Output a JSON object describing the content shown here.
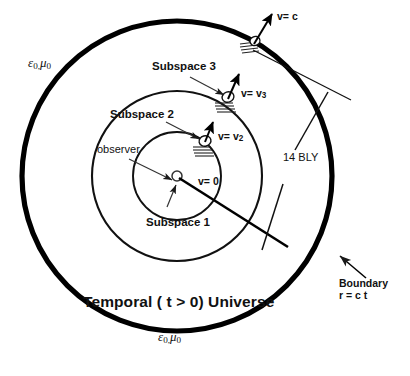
{
  "figure": {
    "colors": {
      "stroke": "#111111",
      "background": "#ffffff",
      "thick_boundary": "#000000"
    }
  },
  "labels": {
    "permittivity_top": "ε",
    "permittivity_top_sub": "0,",
    "permeability_top": "μ",
    "permeability_top_sub": "0",
    "permittivity_bottom": "ε",
    "permittivity_bottom_sub": "0,",
    "permeability_bottom": "μ",
    "permeability_bottom_sub": "0",
    "universe": "Temporal ( t > 0) Universe",
    "subspace_3": "Subspace 3",
    "subspace_2": "Subspace 2",
    "subspace_1": "Subspace 1",
    "observer": "observer",
    "velocity_c": "v= c",
    "velocity_3": "v= v",
    "velocity_3_sub": "3",
    "velocity_2": "v= v",
    "velocity_2_sub": "2",
    "velocity_0": "v= 0",
    "distance": "14 BLY",
    "boundary_line1": "Boundary",
    "boundary_line2": "r = c t"
  },
  "geometry": {
    "center_x": 177,
    "center_y": 176,
    "outer_radius": 155,
    "middle_radius": 85,
    "inner_radius": 44,
    "observer_dot_radius": 5
  },
  "objects": [
    {
      "name": "craft-boundary",
      "x": 254,
      "y": 46,
      "velocity": "v= c"
    },
    {
      "name": "craft-subspace3",
      "x": 228,
      "y": 97,
      "velocity": "v= v3"
    },
    {
      "name": "craft-subspace2",
      "x": 205,
      "y": 140,
      "velocity": "v= v2"
    },
    {
      "name": "observer-center",
      "x": 177,
      "y": 176,
      "velocity": "v= 0"
    }
  ]
}
